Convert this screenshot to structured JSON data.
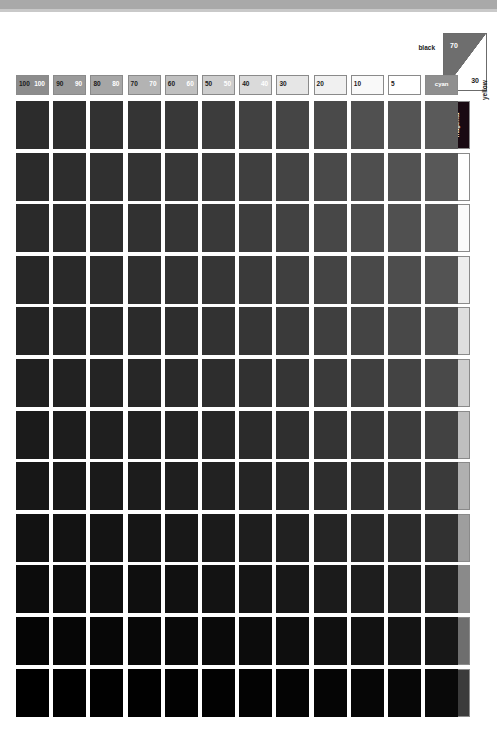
{
  "chart_data": {
    "type": "heatmap",
    "xlabel": "cyan tint %",
    "ylabel": "magenta tint %",
    "grid": false,
    "legend_position": "edges",
    "columns": [
      "100",
      "90",
      "80",
      "70",
      "60",
      "50",
      "40",
      "30",
      "20",
      "10",
      "5",
      "cyan"
    ],
    "rows": [
      "magenta",
      "5",
      "10",
      "20",
      "30",
      "40",
      "50",
      "60",
      "70",
      "80",
      "90",
      "100"
    ],
    "x": [
      100,
      90,
      80,
      70,
      60,
      50,
      40,
      30,
      20,
      10,
      5,
      0
    ],
    "y": [
      0,
      5,
      10,
      20,
      30,
      40,
      50,
      60,
      70,
      80,
      90,
      100
    ],
    "annotations": [
      "black 70 / 30",
      "yellow",
      "magenta",
      "cyan"
    ],
    "values": [
      [
        "#2c2c2c",
        "#2e2e2e",
        "#313131",
        "#343434",
        "#383838",
        "#3c3c3c",
        "#414141",
        "#454545",
        "#4a4a4a",
        "#505050",
        "#545454",
        "#5a5a5a"
      ],
      [
        "#2b2b2b",
        "#2d2d2d",
        "#303030",
        "#333333",
        "#373737",
        "#3b3b3b",
        "#3f3f3f",
        "#444444",
        "#494949",
        "#4e4e4e",
        "#525252",
        "#585858"
      ],
      [
        "#2a2a2a",
        "#2c2c2c",
        "#2e2e2e",
        "#313131",
        "#353535",
        "#393939",
        "#3d3d3d",
        "#424242",
        "#474747",
        "#4c4c4c",
        "#505050",
        "#565656"
      ],
      [
        "#272727",
        "#292929",
        "#2c2c2c",
        "#2f2f2f",
        "#323232",
        "#363636",
        "#3a3a3a",
        "#3f3f3f",
        "#444444",
        "#494949",
        "#4d4d4d",
        "#535353"
      ],
      [
        "#242424",
        "#262626",
        "#282828",
        "#2b2b2b",
        "#2e2e2e",
        "#323232",
        "#363636",
        "#3a3a3a",
        "#3f3f3f",
        "#444444",
        "#484848",
        "#4e4e4e"
      ],
      [
        "#202020",
        "#222222",
        "#242424",
        "#272727",
        "#2a2a2a",
        "#2d2d2d",
        "#313131",
        "#353535",
        "#3a3a3a",
        "#3f3f3f",
        "#434343",
        "#494949"
      ],
      [
        "#1b1b1b",
        "#1d1d1d",
        "#1f1f1f",
        "#212121",
        "#242424",
        "#272727",
        "#2b2b2b",
        "#2f2f2f",
        "#343434",
        "#383838",
        "#3c3c3c",
        "#424242"
      ],
      [
        "#171717",
        "#181818",
        "#1a1a1a",
        "#1c1c1c",
        "#1f1f1f",
        "#222222",
        "#252525",
        "#292929",
        "#2d2d2d",
        "#313131",
        "#353535",
        "#3a3a3a"
      ],
      [
        "#121212",
        "#131313",
        "#141414",
        "#161616",
        "#181818",
        "#1b1b1b",
        "#1e1e1e",
        "#212121",
        "#252525",
        "#292929",
        "#2c2c2c",
        "#313131"
      ],
      [
        "#0c0c0c",
        "#0d0d0d",
        "#0e0e0e",
        "#0f0f0f",
        "#111111",
        "#131313",
        "#151515",
        "#181818",
        "#1b1b1b",
        "#1e1e1e",
        "#212121",
        "#252525"
      ],
      [
        "#050505",
        "#060606",
        "#070707",
        "#080808",
        "#090909",
        "#0a0a0a",
        "#0c0c0c",
        "#0e0e0e",
        "#101010",
        "#121212",
        "#141414",
        "#171717"
      ],
      [
        "#000000",
        "#000000",
        "#010101",
        "#010101",
        "#020202",
        "#020202",
        "#030303",
        "#040404",
        "#050505",
        "#060606",
        "#070707",
        "#090909"
      ]
    ]
  },
  "column_headers": [
    {
      "left": "100",
      "right": "100",
      "bg": "#8c8c8c",
      "fg_left": "#1a1a1a",
      "fg_right": "#ffffff"
    },
    {
      "left": "90",
      "right": "90",
      "bg": "#9a9a9a",
      "fg_left": "#1a1a1a",
      "fg_right": "#ffffff"
    },
    {
      "left": "80",
      "right": "80",
      "bg": "#a6a6a6",
      "fg_left": "#1a1a1a",
      "fg_right": "#ffffff"
    },
    {
      "left": "70",
      "right": "70",
      "bg": "#b3b3b3",
      "fg_left": "#1a1a1a",
      "fg_right": "#ffffff"
    },
    {
      "left": "60",
      "right": "60",
      "bg": "#c0c0c0",
      "fg_left": "#1a1a1a",
      "fg_right": "#ffffff"
    },
    {
      "left": "50",
      "right": "50",
      "bg": "#cdcdcd",
      "fg_left": "#1a1a1a",
      "fg_right": "#ffffff"
    },
    {
      "left": "40",
      "right": "40",
      "bg": "#dadada",
      "fg_left": "#1a1a1a",
      "fg_right": "#ffffff"
    },
    {
      "left": "30",
      "right": "",
      "bg": "#e6e6e6",
      "fg_left": "#1a1a1a",
      "fg_right": "#ffffff"
    },
    {
      "left": "20",
      "right": "",
      "bg": "#f0f0f0",
      "fg_left": "#1a1a1a",
      "fg_right": "#ffffff"
    },
    {
      "left": "10",
      "right": "",
      "bg": "#f9f9f9",
      "fg_left": "#1a1a1a",
      "fg_right": "#ffffff"
    },
    {
      "left": "5",
      "right": "",
      "bg": "#ffffff",
      "fg_left": "#1a1a1a",
      "fg_right": "#ffffff"
    },
    {
      "left": "cyan",
      "right": "",
      "bg": "#8f8f8f",
      "fg_left": "#ffffff",
      "fg_right": "#ffffff"
    }
  ],
  "row_headers": [
    {
      "top": "magenta",
      "bottom": "",
      "bg": "#190a12",
      "fg": "#ffffff",
      "vertical": true
    },
    {
      "top": "5",
      "bottom": "",
      "bg": "#ffffff",
      "fg": "#1a1a1a",
      "vertical": false
    },
    {
      "top": "10",
      "bottom": "",
      "bg": "#fafafa",
      "fg": "#1a1a1a",
      "vertical": false
    },
    {
      "top": "20",
      "bottom": "20",
      "bg": "#ededed",
      "fg": "#1a1a1a",
      "vertical": false
    },
    {
      "top": "30",
      "bottom": "30",
      "bg": "#dedede",
      "fg": "#1a1a1a",
      "vertical": false
    },
    {
      "top": "40",
      "bottom": "40",
      "bg": "#cfcfcf",
      "fg": "#1a1a1a",
      "vertical": false
    },
    {
      "top": "50",
      "bottom": "50",
      "bg": "#bfbfbf",
      "fg": "#1a1a1a",
      "vertical": false
    },
    {
      "top": "60",
      "bottom": "60",
      "bg": "#b0b0b0",
      "fg": "#1a1a1a",
      "vertical": false
    },
    {
      "top": "70",
      "bottom": "70",
      "bg": "#9e9e9e",
      "fg": "#1a1a1a",
      "vertical": false
    },
    {
      "top": "80",
      "bottom": "80",
      "bg": "#8a8a8a",
      "fg": "#1a1a1a",
      "vertical": false
    },
    {
      "top": "90",
      "bottom": "90",
      "bg": "#6e6e6e",
      "fg": "#1a1a1a",
      "vertical": false
    },
    {
      "top": "100",
      "bottom": "100",
      "bg": "#3b3b3b",
      "fg": "#ffffff",
      "vertical": false
    }
  ],
  "corner_reference": {
    "black_label": "black",
    "top_value": "70",
    "bottom_value": "30",
    "top_fill": "#6e6e6e",
    "bottom_fill": "#ffffff"
  },
  "yellow_label": "yellow",
  "top_band_color": "#a9a9a9"
}
